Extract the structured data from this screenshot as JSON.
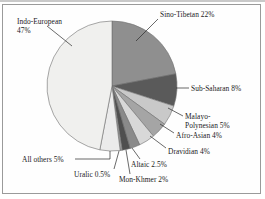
{
  "chart_data": {
    "type": "pie",
    "title": "",
    "subtitle": "",
    "xlabel": "",
    "ylabel": "",
    "legend_position": "none",
    "grid": false,
    "units": "percent of world population",
    "start_angle_deg": 0,
    "direction": "clockwise",
    "categories": [
      "Sino-Tibetan",
      "Sub-Saharan",
      "Malayo-Polynesian",
      "Afro-Asian",
      "Dravidian",
      "Altaic",
      "Mon-Khmer",
      "Uralic",
      "All others",
      "Indo-European"
    ],
    "values": [
      22,
      8,
      5,
      4,
      4,
      2.5,
      2,
      0.5,
      5,
      47
    ],
    "colors": [
      "#8f8f8f",
      "#5a5a5a",
      "#c9c9c9",
      "#a5a5a5",
      "#d8d8d8",
      "#8a8a8a",
      "#4f4f4f",
      "#9d9d9d",
      "#ebebeb",
      "#f0f0ee"
    ],
    "slices": [
      {
        "label": "Sino-Tibetan",
        "value": 22,
        "display": "Sino-Tibetan 22%",
        "color": "#8f8f8f"
      },
      {
        "label": "Sub-Saharan",
        "value": 8,
        "display": "Sub-Saharan 8%",
        "color": "#5a5a5a"
      },
      {
        "label": "Malayo-Polynesian",
        "value": 5,
        "display": "Malayo-Polynesian 5%",
        "color": "#c9c9c9"
      },
      {
        "label": "Afro-Asian",
        "value": 4,
        "display": "Afro-Asian 4%",
        "color": "#a5a5a5"
      },
      {
        "label": "Dravidian",
        "value": 4,
        "display": "Dravidian 4%",
        "color": "#d8d8d8"
      },
      {
        "label": "Altaic",
        "value": 2.5,
        "display": "Altaic 2.5%",
        "color": "#8a8a8a"
      },
      {
        "label": "Mon-Khmer",
        "value": 2,
        "display": "Mon-Khmer 2%",
        "color": "#4f4f4f"
      },
      {
        "label": "Uralic",
        "value": 0.5,
        "display": "Uralic 0.5%",
        "color": "#9d9d9d"
      },
      {
        "label": "All others",
        "value": 5,
        "display": "All others 5%",
        "color": "#ebebeb"
      },
      {
        "label": "Indo-European",
        "value": 47,
        "display": "Indo-European 47%",
        "color": "#f0f0ee"
      }
    ]
  },
  "labels": {
    "indo_european_line1": "Indo-European",
    "indo_european_line2": "47%",
    "sino_tibetan": "Sino-Tibetan 22%",
    "sub_saharan": "Sub-Saharan 8%",
    "malayo_line1": "Malayo-",
    "malayo_line2": "Polynesian 5%",
    "afro_asian": "Afro-Asian 4%",
    "dravidian": "Dravidian 4%",
    "altaic": "Altaic 2.5%",
    "mon_khmer": "Mon-Khmer 2%",
    "uralic": "Uralic 0.5%",
    "all_others": "All others 5%"
  },
  "style": {
    "pie_outline_color": "#6f6f6f",
    "leader_line_color": "#2a2a2a",
    "frame_color": "#9a9a9a",
    "background": "#ffffff",
    "text_color": "#1b1b1b"
  }
}
